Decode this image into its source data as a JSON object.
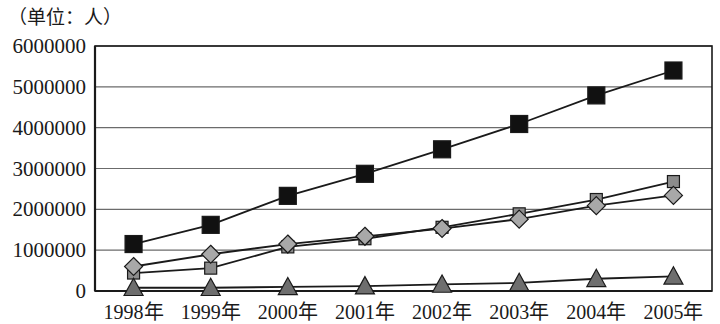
{
  "chart_data": {
    "type": "line",
    "title": "（单位：人）",
    "xlabel": "",
    "ylabel": "",
    "categories": [
      "1998年",
      "1999年",
      "2000年",
      "2001年",
      "2002年",
      "2003年",
      "2004年",
      "2005年"
    ],
    "ylim": [
      0,
      6000000
    ],
    "ytick_labels": [
      "0",
      "1000000",
      "2000000",
      "3000000",
      "4000000",
      "5000000",
      "6000000"
    ],
    "ytick_values": [
      0,
      1000000,
      2000000,
      3000000,
      4000000,
      5000000,
      6000000
    ],
    "grid": true,
    "legend": "none",
    "series": [
      {
        "name": "series-black-square",
        "marker": "square",
        "marker_fill": "#111111",
        "line_color": "#1a1a1a",
        "values": [
          1150000,
          1620000,
          2330000,
          2870000,
          3470000,
          4090000,
          4790000,
          5400000
        ]
      },
      {
        "name": "series-gray-square",
        "marker": "square",
        "marker_fill": "#8c8c8c",
        "line_color": "#1a1a1a",
        "values": [
          440000,
          560000,
          1080000,
          1280000,
          1560000,
          1890000,
          2240000,
          2680000
        ]
      },
      {
        "name": "series-gray-diamond",
        "marker": "diamond",
        "marker_fill": "#a8a8a8",
        "line_color": "#1a1a1a",
        "values": [
          600000,
          900000,
          1150000,
          1340000,
          1530000,
          1760000,
          2090000,
          2340000
        ]
      },
      {
        "name": "series-gray-triangle",
        "marker": "triangle",
        "marker_fill": "#6e6e6e",
        "line_color": "#1a1a1a",
        "values": [
          80000,
          80000,
          100000,
          120000,
          160000,
          200000,
          300000,
          360000
        ]
      }
    ]
  },
  "colors": {
    "axis": "#1a1a1a",
    "grid": "#6b6b6b",
    "text": "#1a1a1a",
    "background": "#ffffff"
  }
}
